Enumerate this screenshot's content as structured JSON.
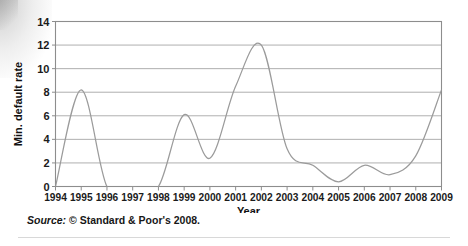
{
  "figure": {
    "source_note_prefix": "Source:",
    "source_note_text": " © Standard & Poor's 2008."
  },
  "colors": {
    "line": "#9b9b9b",
    "grid": "#9a9a9a",
    "frame": "#8d8d8d",
    "text": "#1b1b1b",
    "background": "#ffffff"
  },
  "chart_data": {
    "type": "line",
    "title": "",
    "xlabel": "Year",
    "ylabel": "Min. default rate",
    "grid": true,
    "legend": "none",
    "smoothing": "spline",
    "xlim": [
      1994,
      2009
    ],
    "ylim": [
      0,
      14
    ],
    "ytick_values": [
      0,
      2,
      4,
      6,
      8,
      10,
      12,
      14
    ],
    "ytick_labels": [
      "0",
      "2",
      "4",
      "6",
      "8",
      "10",
      "12",
      "14"
    ],
    "categories": [
      "1994",
      "1995",
      "1996",
      "1997",
      "1998",
      "1999",
      "2000",
      "2001",
      "2002",
      "2003",
      "2004",
      "2005",
      "2006",
      "2007",
      "2008",
      "2009"
    ],
    "x": [
      1994,
      1995,
      1996,
      1997,
      1998,
      1999,
      2000,
      2001,
      2002,
      2003,
      2004,
      2005,
      2006,
      2007,
      2008,
      2009
    ],
    "values": [
      0,
      8.2,
      0,
      0,
      0,
      6.1,
      2.4,
      8.5,
      12.0,
      3.2,
      1.8,
      0.4,
      1.8,
      1.0,
      2.6,
      8.2
    ],
    "series": [
      {
        "name": "Min. default rate",
        "values": [
          0,
          8.2,
          0,
          0,
          0,
          6.1,
          2.4,
          8.5,
          12.0,
          3.2,
          1.8,
          0.4,
          1.8,
          1.0,
          2.6,
          8.2
        ]
      }
    ],
    "annotations": []
  }
}
